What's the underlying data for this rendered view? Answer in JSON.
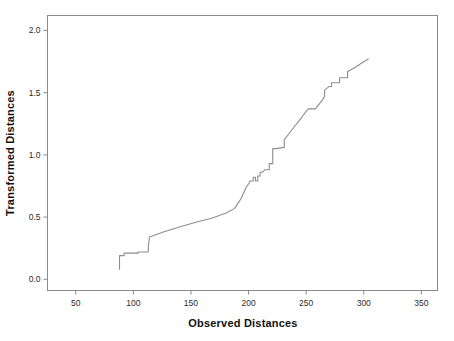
{
  "chart_data": {
    "type": "line",
    "title": "",
    "subtitle": "",
    "xlabel": "Observed Distances",
    "ylabel": "Transformed Distances",
    "xlim": [
      25.5,
      364.0
    ],
    "ylim": [
      -0.09,
      2.12
    ],
    "xticks": [
      50,
      100,
      150,
      200,
      250,
      300,
      350
    ],
    "xticklabels": [
      "50",
      "100",
      "150",
      "200",
      "250",
      "300",
      "350"
    ],
    "yticks": [
      0.0,
      0.5,
      1.0,
      1.5,
      2.0
    ],
    "yticklabels": [
      "0.0",
      "0.5",
      "1.0",
      "1.5",
      "2.0"
    ],
    "grid": false,
    "legend": null,
    "series": [
      {
        "name": "Transformation",
        "line_color": "#8d8d8d",
        "x": [
          88,
          88,
          92,
          92,
          96,
          104,
          104,
          113,
          113,
          114,
          126,
          140,
          155,
          168,
          180,
          188,
          190,
          190,
          193,
          196,
          198,
          201,
          201,
          204,
          204,
          206,
          206,
          208,
          208,
          210,
          210,
          212,
          214,
          216,
          218,
          218,
          221,
          221,
          224,
          231,
          231,
          235,
          240,
          246,
          250,
          252,
          252,
          258,
          264,
          266,
          266,
          270,
          272,
          272,
          276,
          279,
          279,
          284,
          286,
          286,
          292,
          297,
          302,
          304
        ],
        "y": [
          0.08,
          0.19,
          0.19,
          0.21,
          0.21,
          0.21,
          0.22,
          0.22,
          0.26,
          0.34,
          0.38,
          0.42,
          0.46,
          0.49,
          0.53,
          0.57,
          0.6,
          0.6,
          0.64,
          0.7,
          0.74,
          0.78,
          0.79,
          0.79,
          0.82,
          0.82,
          0.79,
          0.79,
          0.83,
          0.83,
          0.86,
          0.86,
          0.88,
          0.88,
          0.88,
          0.93,
          0.93,
          1.05,
          1.05,
          1.06,
          1.12,
          1.17,
          1.23,
          1.3,
          1.35,
          1.37,
          1.37,
          1.37,
          1.44,
          1.47,
          1.52,
          1.55,
          1.55,
          1.58,
          1.58,
          1.58,
          1.62,
          1.62,
          1.62,
          1.67,
          1.7,
          1.73,
          1.76,
          1.77
        ]
      }
    ]
  },
  "axes": {
    "x_title": "Observed Distances",
    "y_title": "Transformed Distances"
  },
  "colors": {
    "line": "#8d8d8d",
    "frame": "#8a8a8a",
    "text": "#111111",
    "background": "#ffffff"
  }
}
